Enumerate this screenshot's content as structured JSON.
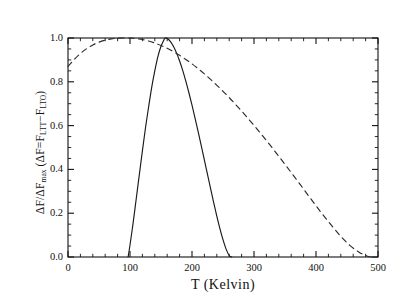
{
  "chart_data": {
    "type": "line",
    "title": "",
    "xlabel": "T  (Kelvin)",
    "ylabel": "ΔF/ΔF",
    "ylabel_sub1": "max",
    "ylabel_mid": "  (ΔF=F",
    "ylabel_sub2": "LTT",
    "ylabel_minus": "−F",
    "ylabel_sub3": "LTO",
    "ylabel_end": ")",
    "xlim": [
      0,
      500
    ],
    "ylim": [
      0.0,
      1.0
    ],
    "xticks": [
      0,
      100,
      200,
      300,
      400,
      500
    ],
    "xtick_labels": [
      "0",
      "100",
      "200",
      "300",
      "400",
      "500"
    ],
    "yticks": [
      0.0,
      0.2,
      0.4,
      0.6,
      0.8,
      1.0
    ],
    "ytick_labels": [
      "0.0",
      "0.2",
      "0.4",
      "0.6",
      "0.8",
      "1.0"
    ],
    "xminor_step": 20,
    "yminor_step": 0.05,
    "grid": false,
    "legend": "none",
    "tick_direction": "in",
    "frame": true,
    "series": [
      {
        "name": "solid-curve",
        "style": "solid",
        "color": "#1a1a1a",
        "x": [
          97,
          100,
          105,
          110,
          115,
          120,
          125,
          130,
          135,
          140,
          145,
          150,
          155,
          157,
          160,
          165,
          170,
          175,
          180,
          185,
          190,
          195,
          200,
          205,
          210,
          215,
          220,
          225,
          230,
          235,
          240,
          245,
          250,
          255,
          260,
          264
        ],
        "y": [
          0.0,
          0.055,
          0.155,
          0.265,
          0.375,
          0.485,
          0.59,
          0.685,
          0.775,
          0.85,
          0.915,
          0.962,
          0.993,
          1.0,
          0.998,
          0.985,
          0.962,
          0.932,
          0.895,
          0.852,
          0.803,
          0.75,
          0.693,
          0.633,
          0.571,
          0.507,
          0.442,
          0.377,
          0.312,
          0.248,
          0.187,
          0.13,
          0.079,
          0.036,
          0.007,
          0.0
        ]
      },
      {
        "name": "dashed-curve",
        "style": "dashed",
        "color": "#2b2b2b",
        "x": [
          0,
          10,
          20,
          30,
          40,
          50,
          60,
          70,
          80,
          90,
          100,
          105,
          110,
          120,
          130,
          140,
          150,
          160,
          170,
          180,
          190,
          200,
          215,
          230,
          245,
          260,
          275,
          290,
          305,
          320,
          335,
          350,
          365,
          380,
          395,
          410,
          425,
          440,
          455,
          470,
          485,
          495
        ],
        "y": [
          0.87,
          0.902,
          0.929,
          0.951,
          0.968,
          0.981,
          0.99,
          0.996,
          0.999,
          1.0,
          1.0,
          0.999,
          0.998,
          0.993,
          0.986,
          0.977,
          0.966,
          0.953,
          0.938,
          0.921,
          0.902,
          0.882,
          0.848,
          0.811,
          0.771,
          0.728,
          0.682,
          0.634,
          0.584,
          0.532,
          0.478,
          0.423,
          0.367,
          0.31,
          0.253,
          0.197,
          0.144,
          0.094,
          0.052,
          0.021,
          0.002,
          0.0
        ]
      }
    ],
    "annotations": {
      "solid_zero_left": 97,
      "solid_peak": 157,
      "solid_zero_right": 264,
      "dashed_peak": 100,
      "dashed_zero_right": 495,
      "dashed_value_at_zero": 0.87
    }
  }
}
